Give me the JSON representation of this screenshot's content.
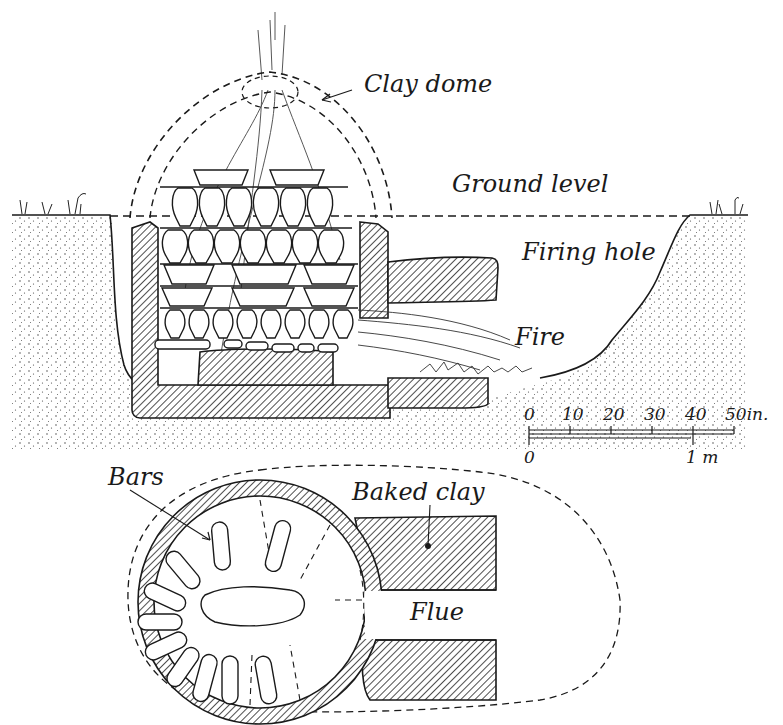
{
  "diagram": {
    "type": "kiln cross-section and plan",
    "section_view": {
      "labels": {
        "clay_dome": "Clay dome",
        "ground_level": "Ground level",
        "firing_hole": "Firing hole",
        "fire": "Fire"
      }
    },
    "plan_view": {
      "labels": {
        "bars": "Bars",
        "baked_clay": "Baked clay",
        "flue": "Flue"
      }
    },
    "scale_bar": {
      "inch_ticks": [
        "0",
        "10",
        "20",
        "30",
        "40",
        "50in."
      ],
      "metric_ticks": [
        "0",
        "1 m"
      ]
    },
    "colors": {
      "ink": "#1a1a1a",
      "paper": "#ffffff"
    }
  }
}
